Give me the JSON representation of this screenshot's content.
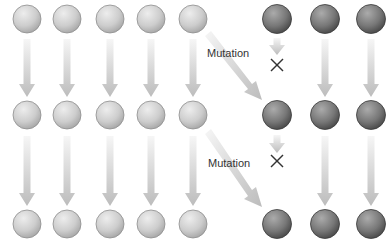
{
  "diagram": {
    "title": "",
    "labels": {
      "mutation_1": "Mutation",
      "mutation_2": "Mutation"
    },
    "colors": {
      "light_cell_highlight": "#ececec",
      "light_cell_shadow": "#a6a6a6",
      "dark_cell_highlight": "#a8a8a8",
      "dark_cell_shadow": "#4a4a4a",
      "arrow_start": "#f4f4f4",
      "arrow_end": "#bdbdbd",
      "blocked_mark": "#333333"
    },
    "rows": [
      {
        "generation": 1,
        "light_cells": 5,
        "dark_cells": 3
      },
      {
        "generation": 2,
        "light_cells": 5,
        "dark_cells": 3
      },
      {
        "generation": 3,
        "light_cells": 5,
        "dark_cells": 3
      }
    ],
    "column_x": [
      27,
      67,
      110,
      151,
      193,
      277,
      325,
      371
    ],
    "row_y": [
      19,
      115,
      224
    ],
    "icons": {
      "blocked": "cross-mark"
    }
  }
}
